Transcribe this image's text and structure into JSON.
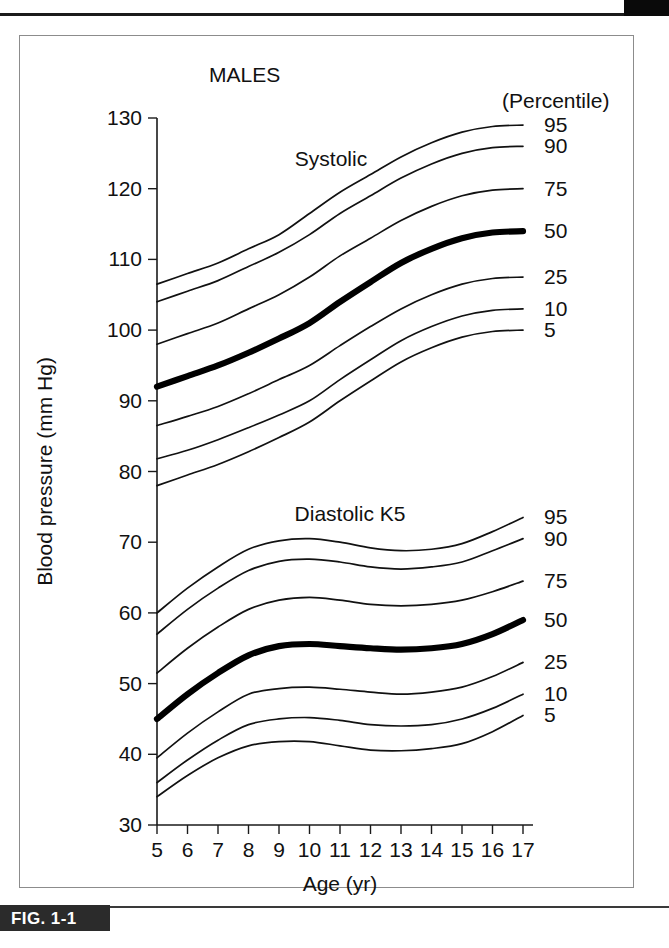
{
  "page": {
    "tab_label": "",
    "caption": "FIG. 1-1"
  },
  "figure": {
    "group_label_males": "MALES",
    "percentile_header": "(Percentile)",
    "systolic_label": "Systolic",
    "diastolic_label": "Diastolic K5"
  },
  "chart_data": {
    "type": "line",
    "title": "MALES",
    "xlabel": "Age (yr)",
    "ylabel": "Blood pressure (mm Hg)",
    "xlim": [
      5,
      17
    ],
    "ylim": [
      30,
      130
    ],
    "xticks": [
      5,
      6,
      7,
      8,
      9,
      10,
      11,
      12,
      13,
      14,
      15,
      16,
      17
    ],
    "yticks": [
      30,
      40,
      50,
      60,
      70,
      80,
      90,
      100,
      110,
      120,
      130
    ],
    "grid": false,
    "legend": "right-edge-percentile-labels",
    "x": [
      5,
      6,
      7,
      8,
      9,
      10,
      11,
      12,
      13,
      14,
      15,
      16,
      17
    ],
    "groups": [
      {
        "name": "Systolic",
        "annotation": "Systolic",
        "series": [
          {
            "name": "95",
            "label": "95",
            "emphasis": false,
            "values": [
              106.5,
              108.0,
              109.5,
              111.5,
              113.5,
              116.5,
              119.5,
              122.0,
              124.5,
              126.5,
              128.0,
              128.8,
              129.0
            ]
          },
          {
            "name": "90",
            "label": "90",
            "emphasis": false,
            "values": [
              104.0,
              105.5,
              107.0,
              109.0,
              111.0,
              113.5,
              116.5,
              119.0,
              121.5,
              123.5,
              125.0,
              125.8,
              126.0
            ]
          },
          {
            "name": "75",
            "label": "75",
            "emphasis": false,
            "values": [
              98.0,
              99.5,
              101.0,
              103.0,
              105.0,
              107.5,
              110.5,
              113.0,
              115.5,
              117.5,
              119.0,
              119.8,
              120.0
            ]
          },
          {
            "name": "50",
            "label": "50",
            "emphasis": true,
            "values": [
              92.0,
              93.5,
              95.0,
              96.8,
              98.8,
              101.0,
              104.0,
              106.8,
              109.5,
              111.5,
              113.0,
              113.8,
              114.0
            ]
          },
          {
            "name": "25",
            "label": "25",
            "emphasis": false,
            "values": [
              86.5,
              87.8,
              89.2,
              91.0,
              93.0,
              95.0,
              97.8,
              100.5,
              103.0,
              105.0,
              106.5,
              107.3,
              107.5
            ]
          },
          {
            "name": "10",
            "label": "10",
            "emphasis": false,
            "values": [
              81.8,
              83.0,
              84.5,
              86.2,
              88.0,
              90.0,
              93.0,
              95.8,
              98.5,
              100.5,
              102.0,
              102.8,
              103.0
            ]
          },
          {
            "name": "5",
            "label": "5",
            "emphasis": false,
            "values": [
              78.0,
              79.5,
              81.0,
              82.8,
              84.8,
              87.0,
              90.0,
              92.8,
              95.5,
              97.5,
              99.0,
              99.8,
              100.0
            ]
          }
        ]
      },
      {
        "name": "Diastolic K5",
        "annotation": "Diastolic K5",
        "series": [
          {
            "name": "95",
            "label": "95",
            "emphasis": false,
            "values": [
              60.0,
              63.5,
              66.5,
              69.0,
              70.2,
              70.5,
              70.0,
              69.2,
              68.8,
              69.0,
              69.8,
              71.5,
              73.5
            ]
          },
          {
            "name": "90",
            "label": "90",
            "emphasis": false,
            "values": [
              57.0,
              60.5,
              63.5,
              66.0,
              67.3,
              67.6,
              67.2,
              66.5,
              66.2,
              66.5,
              67.2,
              68.8,
              70.5
            ]
          },
          {
            "name": "75",
            "label": "75",
            "emphasis": false,
            "values": [
              51.5,
              55.0,
              58.0,
              60.5,
              61.8,
              62.2,
              61.8,
              61.2,
              61.0,
              61.2,
              61.8,
              63.0,
              64.5
            ]
          },
          {
            "name": "50",
            "label": "50",
            "emphasis": true,
            "values": [
              45.0,
              48.5,
              51.5,
              54.0,
              55.3,
              55.6,
              55.3,
              55.0,
              54.8,
              55.0,
              55.6,
              57.0,
              59.0
            ]
          },
          {
            "name": "25",
            "label": "25",
            "emphasis": false,
            "values": [
              39.5,
              43.0,
              46.0,
              48.5,
              49.3,
              49.5,
              49.2,
              48.8,
              48.5,
              48.8,
              49.5,
              51.0,
              53.0
            ]
          },
          {
            "name": "10",
            "label": "10",
            "emphasis": false,
            "values": [
              36.0,
              39.2,
              42.0,
              44.2,
              45.0,
              45.2,
              44.8,
              44.2,
              44.0,
              44.2,
              45.0,
              46.5,
              48.5
            ]
          },
          {
            "name": "5",
            "label": "5",
            "emphasis": false,
            "values": [
              34.0,
              37.0,
              39.5,
              41.2,
              41.8,
              41.8,
              41.2,
              40.6,
              40.5,
              40.8,
              41.5,
              43.2,
              45.5
            ]
          }
        ]
      }
    ]
  }
}
